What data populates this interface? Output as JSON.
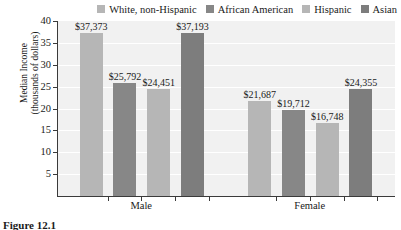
{
  "chart_data": {
    "type": "bar",
    "title": "",
    "xlabel": "",
    "ylabel": "Median Income (thousands of dollars)",
    "ylabel_line1": "Median Income",
    "ylabel_line2": "(thousands of dollars)",
    "ylim": [
      0,
      40
    ],
    "ytick_values": [
      5,
      10,
      15,
      20,
      25,
      30,
      35,
      40
    ],
    "ytick_labels": [
      "5",
      "10",
      "15",
      "20",
      "25",
      "30",
      "35",
      "40"
    ],
    "grid": true,
    "legend_position": "top-right",
    "categories": [
      "Male",
      "Female"
    ],
    "series": [
      {
        "name": "White, non-Hispanic",
        "color": "#b6b6b6",
        "values": [
          37373,
          21687
        ],
        "labels": [
          "$37,373",
          "$21,687"
        ]
      },
      {
        "name": "African American",
        "color": "#878787",
        "values": [
          25792,
          19712
        ],
        "labels": [
          "$25,792",
          "$19,712"
        ]
      },
      {
        "name": "Hispanic",
        "color": "#b6b6b6",
        "values": [
          24451,
          16748
        ],
        "labels": [
          "$24,451",
          "$16,748"
        ]
      },
      {
        "name": "Asian",
        "color": "#7d7d7d",
        "values": [
          37193,
          24355
        ],
        "labels": [
          "$37,193",
          "$24,355"
        ]
      }
    ]
  },
  "legend": {
    "items": [
      {
        "label": "White, non-Hispanic",
        "color": "#b6b6b6"
      },
      {
        "label": "African American",
        "color": "#878787"
      },
      {
        "label": "Hispanic",
        "color": "#b6b6b6"
      },
      {
        "label": "Asian",
        "color": "#7d7d7d"
      }
    ]
  },
  "caption": {
    "text": "Figure 12.1"
  }
}
